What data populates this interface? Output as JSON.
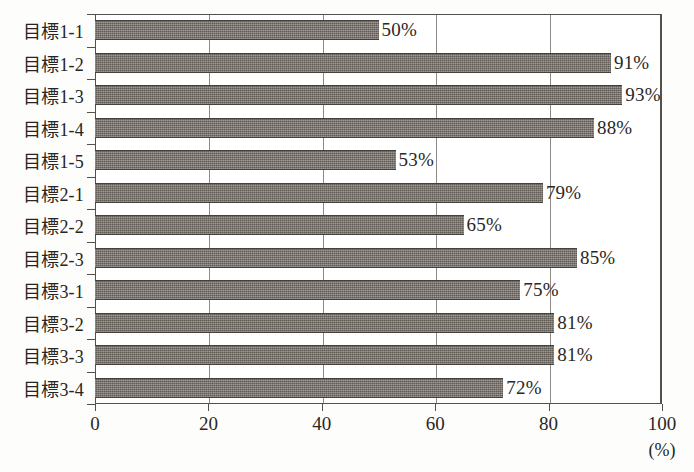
{
  "chart_data": {
    "type": "bar",
    "orientation": "horizontal",
    "title": "",
    "xlabel": "(%)",
    "ylabel": "",
    "xlim": [
      0,
      100
    ],
    "grid": true,
    "legend": null,
    "xticks": [
      "0",
      "20",
      "40",
      "60",
      "80",
      "100"
    ],
    "xtick_values": [
      0,
      20,
      40,
      60,
      80,
      100
    ],
    "unit_label": "(%)",
    "categories": [
      "目標1-1",
      "目標1-2",
      "目標1-3",
      "目標1-4",
      "目標1-5",
      "目標2-1",
      "目標2-2",
      "目標2-3",
      "目標3-1",
      "目標3-2",
      "目標3-3",
      "目標3-4"
    ],
    "values": [
      50,
      91,
      93,
      88,
      53,
      79,
      65,
      85,
      75,
      81,
      81,
      72
    ],
    "value_labels": [
      "50%",
      "91%",
      "93%",
      "88%",
      "53%",
      "79%",
      "65%",
      "85%",
      "75%",
      "81%",
      "81%",
      "72%"
    ],
    "colors": {
      "bar_fill": "#767069",
      "bar_edge": "#45403a",
      "gridline": "#8e8a85",
      "axis": "#555049",
      "text": "#2a2724",
      "background": "#fdfdfc"
    }
  }
}
